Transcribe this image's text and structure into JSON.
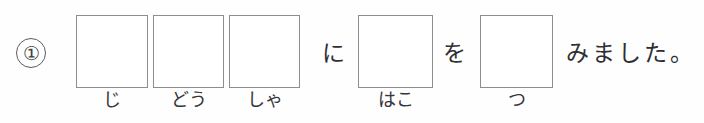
{
  "exercise": {
    "number_label": "①",
    "sentence_plain": "じどうしゃにはこをつみました。",
    "slots": [
      {
        "id": "slot-1",
        "furigana": "じ",
        "value": ""
      },
      {
        "id": "slot-2",
        "furigana": "どう",
        "value": ""
      },
      {
        "id": "slot-3",
        "furigana": "しゃ",
        "value": ""
      },
      {
        "id": "slot-4",
        "furigana": "はこ",
        "value": ""
      },
      {
        "id": "slot-5",
        "furigana": "つ",
        "value": ""
      }
    ],
    "particles": {
      "ni": "に",
      "wo": "を"
    },
    "tail": "みました。"
  },
  "colors": {
    "box_border": "#8d8d8d",
    "text": "#2e2e33",
    "number_border": "#5c5c5c",
    "page_background": "#fefefe"
  }
}
